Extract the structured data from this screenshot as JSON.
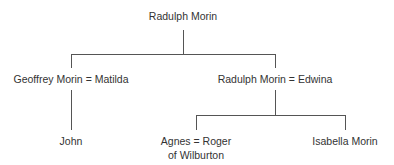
{
  "diagram": {
    "type": "family-tree",
    "colors": {
      "line": "#555555",
      "text": "#333333",
      "background": "#ffffff"
    },
    "nodes": {
      "root": {
        "label": "Radulph Morin"
      },
      "geoffrey": {
        "label": "Geoffrey Morin = Matilda"
      },
      "radulph2": {
        "label": "Radulph Morin = Edwina"
      },
      "john": {
        "label": "John"
      },
      "agnes": {
        "label": "Agnes = Roger of Wilburton"
      },
      "isabella": {
        "label": "Isabella Morin"
      }
    },
    "edges": [
      {
        "from": "root",
        "to": "geoffrey"
      },
      {
        "from": "root",
        "to": "radulph2"
      },
      {
        "from": "geoffrey",
        "to": "john"
      },
      {
        "from": "radulph2",
        "to": "agnes"
      },
      {
        "from": "radulph2",
        "to": "isabella"
      }
    ]
  }
}
